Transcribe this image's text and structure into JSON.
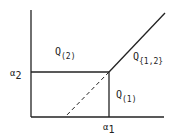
{
  "diagram": {
    "axes": {
      "x_tick_label": "α",
      "x_tick_sub": "1",
      "y_tick_label": "α",
      "y_tick_sub": "2"
    },
    "regions": [
      {
        "id": "q2",
        "label": "Q",
        "sub": "(2)"
      },
      {
        "id": "q12",
        "label": "Q",
        "sub": "{1,2}"
      },
      {
        "id": "q1",
        "label": "Q",
        "sub": "(1)"
      }
    ],
    "colors": {
      "line": "#222222",
      "background": "#ffffff"
    }
  }
}
